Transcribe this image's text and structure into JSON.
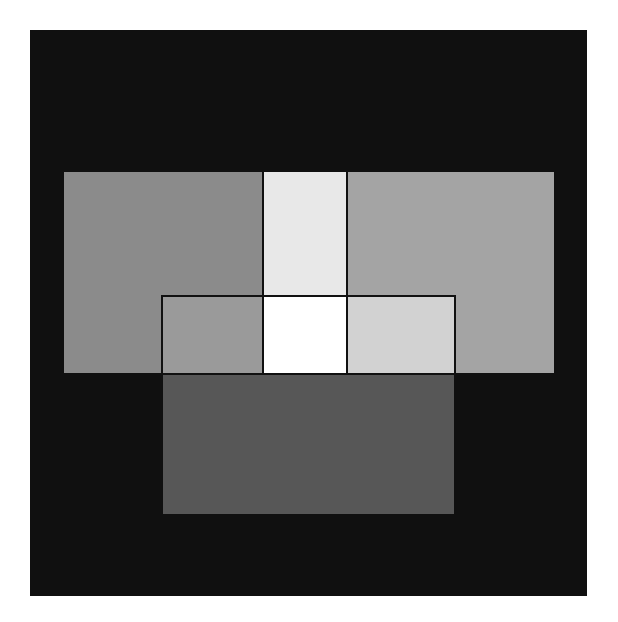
{
  "figure": {
    "background_color": "#101010",
    "regions": [
      {
        "name": "left-panel",
        "color": "#8b8b8b"
      },
      {
        "name": "right-panel",
        "color": "#a4a4a4"
      },
      {
        "name": "top-center-strip",
        "color": "#e8e8e8"
      },
      {
        "name": "bottom-panel",
        "color": "#575757"
      },
      {
        "name": "inner-left-cell",
        "color": "#9a9a9a"
      },
      {
        "name": "inner-center-cell",
        "color": "#ffffff"
      },
      {
        "name": "inner-right-cell",
        "color": "#d2d2d2"
      }
    ]
  }
}
